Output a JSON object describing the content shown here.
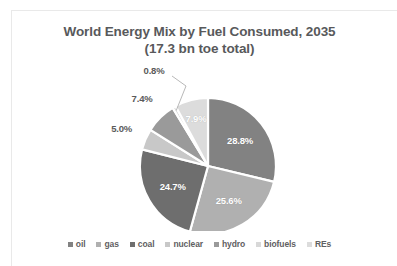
{
  "chart_data": {
    "type": "pie",
    "title": "World Energy Mix by Fuel Consumed, 2035",
    "subtitle": "(17.3 bn toe total)",
    "title_line1": "World Energy Mix by Fuel Consumed, 2035",
    "title_line2": "(17.3 bn toe total)",
    "units": "bn toe",
    "total": 17.3,
    "xlabel": "",
    "ylabel": "",
    "legend_position": "bottom",
    "grid": false,
    "start_angle_deg": 0,
    "direction": "clockwise",
    "categories": [
      "oil",
      "gas",
      "coal",
      "nuclear",
      "hydro",
      "biofuels",
      "REs"
    ],
    "values": [
      28.8,
      25.6,
      24.7,
      5.0,
      7.4,
      0.8,
      7.9
    ],
    "value_suffix": "%",
    "colors": [
      "#828282",
      "#b0b0b0",
      "#6e6e6e",
      "#c8c8c8",
      "#9a9a9a",
      "#d8d8d8",
      "#dcdcdc"
    ],
    "slices": [
      {
        "label": "oil",
        "value": 28.8,
        "display": "28.8%",
        "color": "#828282",
        "label_placement": "inside"
      },
      {
        "label": "gas",
        "value": 25.6,
        "display": "25.6%",
        "color": "#b0b0b0",
        "label_placement": "inside"
      },
      {
        "label": "coal",
        "value": 24.7,
        "display": "24.7%",
        "color": "#6e6e6e",
        "label_placement": "inside"
      },
      {
        "label": "nuclear",
        "value": 5.0,
        "display": "5.0%",
        "color": "#c8c8c8",
        "label_placement": "outside"
      },
      {
        "label": "hydro",
        "value": 7.4,
        "display": "7.4%",
        "color": "#9a9a9a",
        "label_placement": "outside"
      },
      {
        "label": "biofuels",
        "value": 0.8,
        "display": "0.8%",
        "color": "#d8d8d8",
        "label_placement": "outside-leader"
      },
      {
        "label": "REs",
        "value": 7.9,
        "display": "7.9%",
        "color": "#dcdcdc",
        "label_placement": "inside"
      }
    ]
  },
  "legend": {
    "items": [
      {
        "label": "oil",
        "color": "#828282"
      },
      {
        "label": "gas",
        "color": "#b0b0b0"
      },
      {
        "label": "coal",
        "color": "#6e6e6e"
      },
      {
        "label": "nuclear",
        "color": "#c8c8c8"
      },
      {
        "label": "hydro",
        "color": "#9a9a9a"
      },
      {
        "label": "biofuels",
        "color": "#d8d8d8"
      },
      {
        "label": "REs",
        "color": "#dcdcdc"
      }
    ]
  },
  "theme": {
    "background": "#ffffff",
    "title_color": "#58595b",
    "legend_text_color": "#5f6062",
    "inside_label_color": "#ffffff",
    "outside_label_color": "#5a5a5a",
    "border_color": "#e9e9e9",
    "slice_gap_color": "#ffffff"
  }
}
